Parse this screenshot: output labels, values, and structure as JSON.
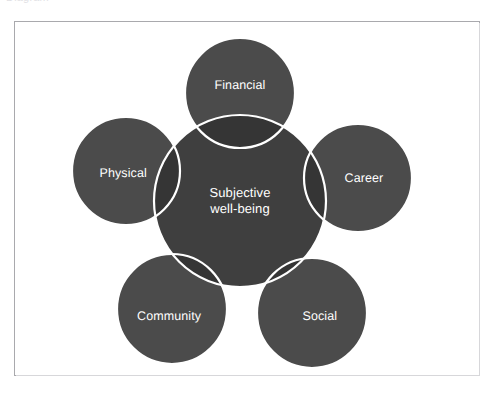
{
  "page": {
    "background_color": "#ffffff",
    "frame_border_color": "#a9a9ad",
    "top_clipped_text": "Diagram"
  },
  "diagram": {
    "type": "venn-petal-cluster",
    "center": {
      "id": "center-node",
      "label_line1": "Subjective",
      "label_line2": "well-being",
      "fill_color": "#3f3f3f",
      "stroke_color": "#ffffff",
      "cx": 240,
      "cy": 201,
      "r": 86
    },
    "satellites": [
      {
        "id": "financial",
        "label": "Financial",
        "fill_color": "#4b4b4b",
        "stroke_color": "#ffffff",
        "cx": 240,
        "cy": 93,
        "r": 55,
        "label_dx": 0,
        "label_dy": -8
      },
      {
        "id": "physical",
        "label": "Physical",
        "fill_color": "#4b4b4b",
        "stroke_color": "#ffffff",
        "cx": 126,
        "cy": 171,
        "r": 54,
        "label_dx": -3,
        "label_dy": 2
      },
      {
        "id": "career",
        "label": "Career",
        "fill_color": "#4b4b4b",
        "stroke_color": "#ffffff",
        "cx": 358,
        "cy": 178,
        "r": 54,
        "label_dx": 6,
        "label_dy": 0
      },
      {
        "id": "community",
        "label": "Community",
        "fill_color": "#4b4b4b",
        "stroke_color": "#ffffff",
        "cx": 172,
        "cy": 309,
        "r": 55,
        "label_dx": -3,
        "label_dy": 7
      },
      {
        "id": "social",
        "label": "Social",
        "fill_color": "#4b4b4b",
        "stroke_color": "#ffffff",
        "cx": 312,
        "cy": 313,
        "r": 55,
        "label_dx": 8,
        "label_dy": 3
      }
    ],
    "overlap_fill_color": "#353535",
    "text_color": "#ffffff"
  }
}
